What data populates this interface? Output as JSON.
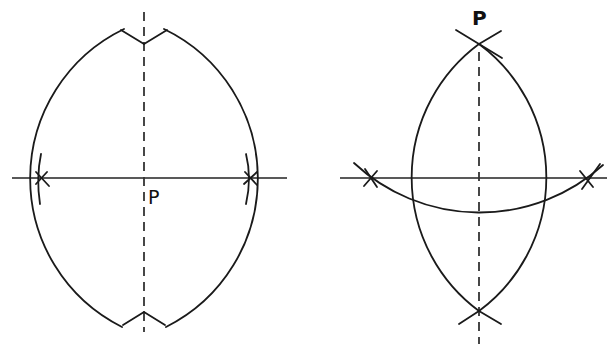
{
  "figures": [
    {
      "id": "left",
      "description": "Perpendicular bisector construction through point P on a line",
      "point_label": "P",
      "horizontal_line": {
        "x1": 12,
        "x2": 287,
        "y": 178
      },
      "vertical_dashed_line": {
        "x": 144,
        "y1": 12,
        "y2": 330
      },
      "lens_top": [
        144,
        44
      ],
      "lens_bottom": [
        144,
        312
      ],
      "marks": [
        [
          40,
          178
        ],
        [
          251,
          178
        ]
      ],
      "arc_radius": 166
    },
    {
      "id": "right",
      "description": "Perpendicular from point P to a line",
      "point_label": "P",
      "horizontal_line": {
        "x1": 340,
        "x2": 607,
        "y": 178
      },
      "vertical_dashed_line": {
        "x": 479,
        "y1": 50,
        "y2": 344
      },
      "lens_top": [
        479,
        44
      ],
      "lens_bottom": [
        479,
        311
      ],
      "marks": [
        [
          371,
          178
        ],
        [
          587,
          178
        ]
      ],
      "arc_radius": 166,
      "lower_arc": {
        "cx": 479,
        "cy": 29,
        "r": 184
      }
    }
  ]
}
